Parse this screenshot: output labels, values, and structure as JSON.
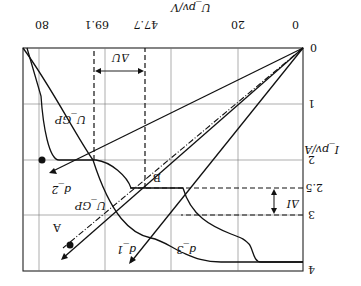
{
  "figure": {
    "orientation": "rotated 180 degrees",
    "x_axis": {
      "label": "U_pv/V",
      "ticks": [
        "0",
        "20",
        "47.7",
        "69.1",
        "80"
      ]
    },
    "y_axis": {
      "label": "I_pv/A",
      "ticks": [
        "0",
        "1",
        "2",
        "2.5",
        "3",
        "4"
      ]
    },
    "origin_label": "0",
    "curve_labels": {
      "ugp_top": "U_GP",
      "ugp_bottom": "U_GP",
      "point_a": "A",
      "point_b": "B"
    },
    "line_labels": {
      "d1": "d_1",
      "d2": "d_2",
      "d3": "d_3"
    },
    "annotations": {
      "delta_u": "ΔU",
      "delta_i": "ΔI"
    }
  }
}
